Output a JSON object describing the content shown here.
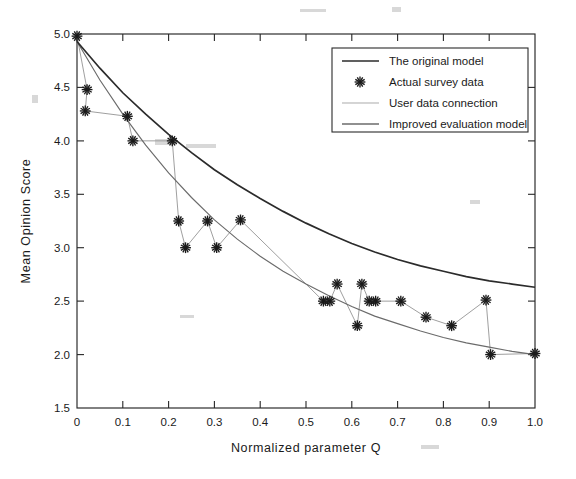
{
  "chart_data": {
    "type": "line",
    "title": "",
    "xlabel": "Normalized  parameter  Q",
    "ylabel": "Mean  Opinion  Score",
    "xlim": [
      0,
      1.0
    ],
    "ylim": [
      1.5,
      5.0
    ],
    "grid": false,
    "xticks": [
      "0",
      "0.1",
      "0.2",
      "0.3",
      "0.4",
      "0.5",
      "0.6",
      "0.7",
      "0.8",
      "0.9",
      "1.0"
    ],
    "xtick_values": [
      0,
      0.1,
      0.2,
      0.3,
      0.4,
      0.5,
      0.6,
      0.7,
      0.8,
      0.9,
      1.0
    ],
    "yticks": [
      "1.5",
      "2.0",
      "2.5",
      "3.0",
      "3.5",
      "4.0",
      "4.5",
      "5.0"
    ],
    "ytick_values": [
      1.5,
      2.0,
      2.5,
      3.0,
      3.5,
      4.0,
      4.5,
      5.0
    ],
    "legend_position": "upper right",
    "legend_entries": [
      {
        "label": "The original model",
        "style": "line",
        "color": "#2b2b2b"
      },
      {
        "label": "Actual survey data",
        "style": "marker",
        "color": "#1a1a1a"
      },
      {
        "label": "User data connection",
        "style": "line",
        "color": "#a5a5a5"
      },
      {
        "label": "Improved evaluation model",
        "style": "line",
        "color": "#6b6b6b"
      }
    ],
    "series": [
      {
        "name": "The original model",
        "type": "line",
        "color": "#2b2b2b",
        "x": [
          0.0,
          0.05,
          0.1,
          0.15,
          0.2,
          0.25,
          0.3,
          0.35,
          0.4,
          0.45,
          0.5,
          0.55,
          0.6,
          0.65,
          0.7,
          0.75,
          0.8,
          0.85,
          0.9,
          0.95,
          1.0
        ],
        "values": [
          4.93,
          4.68,
          4.45,
          4.25,
          4.06,
          3.89,
          3.73,
          3.59,
          3.46,
          3.34,
          3.23,
          3.13,
          3.04,
          2.96,
          2.89,
          2.83,
          2.78,
          2.73,
          2.69,
          2.66,
          2.63
        ]
      },
      {
        "name": "Improved evaluation model",
        "type": "line",
        "color": "#6b6b6b",
        "x": [
          0.0,
          0.05,
          0.1,
          0.15,
          0.2,
          0.25,
          0.3,
          0.35,
          0.4,
          0.45,
          0.5,
          0.55,
          0.6,
          0.65,
          0.7,
          0.75,
          0.8,
          0.85,
          0.9,
          0.95,
          1.0
        ],
        "values": [
          4.93,
          4.57,
          4.25,
          3.96,
          3.7,
          3.47,
          3.26,
          3.08,
          2.92,
          2.78,
          2.66,
          2.55,
          2.45,
          2.36,
          2.29,
          2.22,
          2.16,
          2.11,
          2.07,
          2.03,
          2.0
        ]
      },
      {
        "name": "Actual survey data",
        "type": "scatter",
        "color": "#1a1a1a",
        "marker": "asterisk",
        "points": [
          [
            0.0,
            4.98
          ],
          [
            0.022,
            4.48
          ],
          [
            0.018,
            4.28
          ],
          [
            0.11,
            4.23
          ],
          [
            0.122,
            4.0
          ],
          [
            0.208,
            4.0
          ],
          [
            0.222,
            3.25
          ],
          [
            0.237,
            3.0
          ],
          [
            0.285,
            3.25
          ],
          [
            0.305,
            3.0
          ],
          [
            0.357,
            3.26
          ],
          [
            0.538,
            2.5
          ],
          [
            0.552,
            2.5
          ],
          [
            0.568,
            2.66
          ],
          [
            0.612,
            2.27
          ],
          [
            0.622,
            2.66
          ],
          [
            0.638,
            2.5
          ],
          [
            0.652,
            2.5
          ],
          [
            0.707,
            2.5
          ],
          [
            0.762,
            2.35
          ],
          [
            0.818,
            2.27
          ],
          [
            0.893,
            2.51
          ],
          [
            0.903,
            2.0
          ],
          [
            1.0,
            2.01
          ]
        ]
      },
      {
        "name": "User data connection",
        "type": "line",
        "color": "#a5a5a5",
        "description": "polyline connecting the actual survey data points in order"
      }
    ]
  },
  "axes": {
    "y_axis_title": "Mean  Opinion  Score",
    "x_axis_title": "Normalized  parameter  Q"
  },
  "legend": {
    "item_0": "The original model",
    "item_1": "Actual survey data",
    "item_2": "User data connection",
    "item_3": "Improved evaluation model"
  },
  "xtick_labels": {
    "t0": "0",
    "t1": "0.1",
    "t2": "0.2",
    "t3": "0.3",
    "t4": "0.4",
    "t5": "0.5",
    "t6": "0.6",
    "t7": "0.7",
    "t8": "0.8",
    "t9": "0.9",
    "t10": "1.0"
  },
  "ytick_labels": {
    "t0": "1.5",
    "t1": "2.0",
    "t2": "2.5",
    "t3": "3.0",
    "t4": "3.5",
    "t5": "4.0",
    "t6": "4.5",
    "t7": "5.0"
  }
}
